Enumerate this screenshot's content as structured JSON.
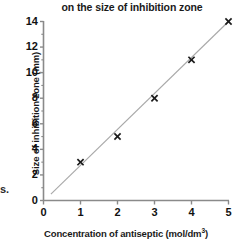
{
  "chart_data": {
    "type": "scatter",
    "title": "on the size of inhibition zone",
    "xlabel_text": "Concentration of antiseptic (mol/dm",
    "xlabel_sup": "3",
    "xlabel_tail": ")",
    "xlabel": "Concentration of antiseptic (mol/dm3)",
    "ylabel": "Size of inhibition zone (mm)",
    "x": [
      1,
      2,
      3,
      4,
      5
    ],
    "values": [
      3,
      5,
      8,
      11,
      14
    ],
    "series": [
      {
        "name": "Size of inhibition zone",
        "marker": "x",
        "values": [
          3,
          5,
          8,
          11,
          14
        ]
      }
    ],
    "trendline": {
      "visible": true,
      "x_start": 0.2,
      "y_start": 0.5,
      "x_end": 5.0,
      "y_end": 14.0
    },
    "xlim": [
      0,
      5
    ],
    "ylim": [
      0,
      14
    ],
    "xticks": [
      "0",
      "1",
      "2",
      "3",
      "4",
      "5"
    ],
    "yticks": [
      "0",
      "2",
      "4",
      "6",
      "8",
      "10",
      "12",
      "14"
    ],
    "xtick_values": [
      0,
      1,
      2,
      3,
      4,
      5
    ],
    "ytick_values": [
      0,
      2,
      4,
      6,
      8,
      10,
      12,
      14
    ],
    "y_minor_ticks": [
      1,
      3,
      5,
      7,
      9,
      11,
      13
    ],
    "grid": false,
    "legend": "none",
    "colors": {
      "axis": "#8a8a8a",
      "marker": "#1a1a1a",
      "line": "#a8a8a8",
      "text": "#1a1a1a",
      "background": "#ffffff"
    }
  },
  "margin_note": {
    "fragment": "s."
  }
}
